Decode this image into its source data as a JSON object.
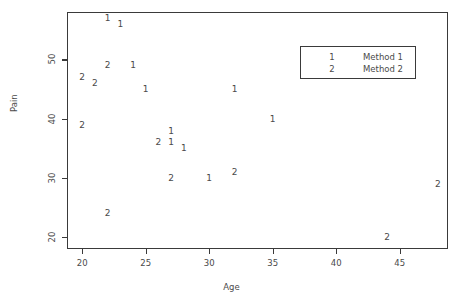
{
  "chart_data": {
    "type": "scatter",
    "title": "",
    "xlabel": "Age",
    "ylabel": "Pain",
    "xlim": [
      18.8,
      48.8
    ],
    "ylim": [
      18.0,
      58.0
    ],
    "grid": false,
    "legend_position": "top-right",
    "xticks": [
      20,
      25,
      30,
      35,
      40,
      45
    ],
    "xtick_labels": [
      "20",
      "25",
      "30",
      "35",
      "40",
      "45"
    ],
    "yticks": [
      20,
      30,
      40,
      50
    ],
    "ytick_labels": [
      "20",
      "30",
      "40",
      "50"
    ],
    "series": [
      {
        "name": "Method 1",
        "marker": "1",
        "points": [
          {
            "x": 22,
            "y": 57,
            "label": "1"
          },
          {
            "x": 23,
            "y": 56,
            "label": "1"
          },
          {
            "x": 24,
            "y": 49,
            "label": "1"
          },
          {
            "x": 25,
            "y": 45,
            "label": "1"
          },
          {
            "x": 27,
            "y": 38,
            "label": "1"
          },
          {
            "x": 27,
            "y": 36,
            "label": "1"
          },
          {
            "x": 28,
            "y": 35,
            "label": "1"
          },
          {
            "x": 30,
            "y": 30,
            "label": "1"
          },
          {
            "x": 32,
            "y": 45,
            "label": "1"
          },
          {
            "x": 35,
            "y": 40,
            "label": "1"
          }
        ]
      },
      {
        "name": "Method 2",
        "marker": "2",
        "points": [
          {
            "x": 20,
            "y": 47,
            "label": "2"
          },
          {
            "x": 21,
            "y": 46,
            "label": "2"
          },
          {
            "x": 22,
            "y": 49,
            "label": "2"
          },
          {
            "x": 20,
            "y": 39,
            "label": "2"
          },
          {
            "x": 22,
            "y": 24,
            "label": "2"
          },
          {
            "x": 26,
            "y": 36,
            "label": "2"
          },
          {
            "x": 27,
            "y": 30,
            "label": "2"
          },
          {
            "x": 32,
            "y": 31,
            "label": "2"
          },
          {
            "x": 44,
            "y": 20,
            "label": "2"
          },
          {
            "x": 48,
            "y": 29,
            "label": "2"
          }
        ]
      }
    ],
    "legend": {
      "entries": [
        {
          "key": "1",
          "label": "Method 1"
        },
        {
          "key": "2",
          "label": "Method 2"
        }
      ]
    }
  }
}
